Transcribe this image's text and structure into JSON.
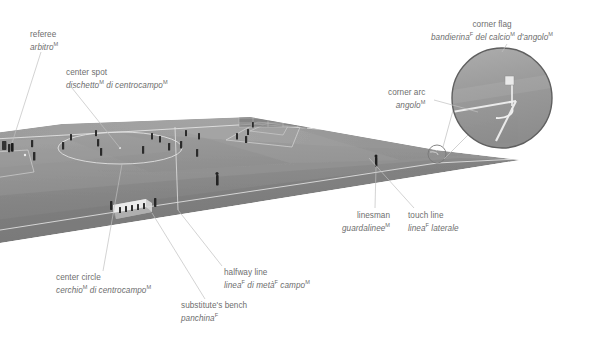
{
  "figure": {
    "kind": "annotated-photo-diagram",
    "background_color": "#ffffff",
    "pitch_color": "#8f8f8f",
    "label_color": "#6e6e6e",
    "leader_line_color": "#b9b9b9"
  },
  "labels": {
    "referee": {
      "en": "referee",
      "it": "arbitro",
      "it_sup": "M",
      "sup_en": ""
    },
    "center_spot": {
      "en": "center spot",
      "it": "dischetto",
      "it_sup": "M",
      "it2": " di centrocampo",
      "it2_sup": "M"
    },
    "corner_flag": {
      "en": "corner flag",
      "it": "bandierina",
      "it_sup": "F",
      "it2": " del calcio",
      "it2_sup": "M",
      "it3": " d'angolo",
      "it3_sup": "M"
    },
    "corner_arc": {
      "en": "corner arc",
      "it": "angolo",
      "it_sup": "M"
    },
    "linesman": {
      "en": "linesman",
      "it": "guardalinee",
      "it_sup": "M"
    },
    "touch_line": {
      "en": "touch line",
      "it": "linea",
      "it_sup": "F",
      "it2": " laterale"
    },
    "center_circle": {
      "en": "center circle",
      "it": "cerchio",
      "it_sup": "M",
      "it2": " di centrocampo",
      "it2_sup": "M"
    },
    "halfway_line": {
      "en": "halfway line",
      "it": "linea",
      "it_sup": "F",
      "it2": " di metà",
      "it2_sup": "F",
      "it3": " campo",
      "it3_sup": "M"
    },
    "bench": {
      "en": "substitute's bench",
      "it": "panchina",
      "it_sup": "F"
    }
  },
  "inset": {
    "name": "corner-detail-magnifier",
    "shows": "corner flag and corner arc"
  }
}
